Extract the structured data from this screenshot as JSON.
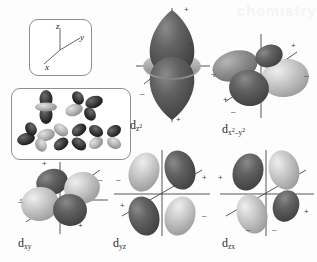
{
  "figure": {
    "background": "#fdfdfd",
    "watermark": "chemistry"
  },
  "axis_legend": {
    "name": "coordinate-axes-key",
    "axes": [
      {
        "label": "z",
        "direction": "up"
      },
      {
        "label": "y",
        "direction": "upper-right"
      },
      {
        "label": "x",
        "direction": "lower-left"
      }
    ]
  },
  "orbital_set_box": {
    "name": "all-five-d-orbitals-thumbnail",
    "count": 5,
    "thumbnails": [
      {
        "label": "dz2",
        "type": "dz2",
        "row": 0,
        "col": 0
      },
      {
        "label": "dx2-y2",
        "type": "cloverleaf",
        "row": 0,
        "col": 1
      },
      {
        "label": "dxy",
        "type": "cloverleaf",
        "row": 1,
        "col": 0
      },
      {
        "label": "dyz",
        "type": "cloverleaf",
        "row": 1,
        "col": 1
      },
      {
        "label": "dzx",
        "type": "cloverleaf",
        "row": 1,
        "col": 2
      }
    ]
  },
  "orbitals": [
    {
      "id": "dz2",
      "label_main": "d",
      "label_sub": "z",
      "label_sup": "2",
      "shape": "dz2",
      "lobe_signs": [
        "+",
        "-",
        "-",
        "+"
      ],
      "colors": {
        "dark": "#5c5c5c",
        "light": "#b9b9b9"
      }
    },
    {
      "id": "dx2-y2",
      "label_main": "d",
      "label_sub": "x",
      "label_sup": "2",
      "label_sub2": "-y",
      "label_sup2": "2",
      "shape": "cloverleaf",
      "lobe_signs": [
        "+",
        "-",
        "+",
        "-"
      ],
      "colors": {
        "dark": "#5c5c5c",
        "light": "#b9b9b9"
      }
    },
    {
      "id": "dxy",
      "label_main": "d",
      "label_sub": "xy",
      "shape": "cloverleaf",
      "lobe_signs": [
        "+",
        "-",
        "+",
        "-"
      ],
      "colors": {
        "dark": "#5c5c5c",
        "light": "#b9b9b9"
      }
    },
    {
      "id": "dyz",
      "label_main": "d",
      "label_sub": "yz",
      "shape": "cloverleaf",
      "lobe_signs": [
        "+",
        "-",
        "+",
        "-"
      ],
      "colors": {
        "dark": "#5c5c5c",
        "light": "#b9b9b9"
      }
    },
    {
      "id": "dzx",
      "label_main": "d",
      "label_sub": "zx",
      "shape": "cloverleaf",
      "lobe_signs": [
        "+",
        "-",
        "+",
        "-"
      ],
      "colors": {
        "dark": "#5c5c5c",
        "light": "#b9b9b9"
      }
    }
  ],
  "labels": {
    "dz2": "d",
    "dz2_sub": "z",
    "dz2_sup": "2",
    "dx2y2": "d",
    "dx2y2_sub": "x",
    "dxy": "d",
    "dxy_sub": "xy",
    "dyz": "d",
    "dyz_sub": "yz",
    "dzx": "d",
    "dzx_sub": "zx"
  },
  "signs": {
    "plus": "+",
    "minus": "–"
  }
}
